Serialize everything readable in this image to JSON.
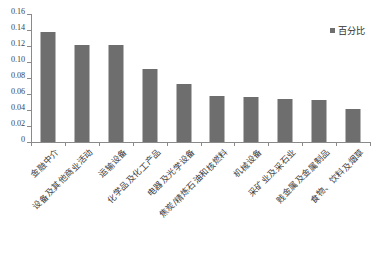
{
  "chart_data": {
    "type": "bar",
    "title": "",
    "subtitle": "",
    "xlabel": "",
    "ylabel": "",
    "ylim": [
      0,
      0.16
    ],
    "grid": false,
    "legend_position": "top-right",
    "y_ticks": [
      "0",
      "0.02",
      "0.04",
      "0.06",
      "0.08",
      "0.10",
      "0.12",
      "0.14",
      "0.16"
    ],
    "y_tick_values": [
      0,
      0.02,
      0.04,
      0.06,
      0.08,
      0.1,
      0.12,
      0.14,
      0.16
    ],
    "categories": [
      "金融中介",
      "设备及其他商业活动",
      "运输设备",
      "化学品及化工产品",
      "电器及光学设备",
      "焦炭/精炼石油和核燃料",
      "机械设备",
      "采矿业及采石业",
      "贱金属及金属制品",
      "食物、饮料及烟草"
    ],
    "series": [
      {
        "name": "百分比",
        "color": "#6e6e6e",
        "values": [
          0.138,
          0.121,
          0.121,
          0.091,
          0.073,
          0.057,
          0.056,
          0.054,
          0.052,
          0.041
        ]
      }
    ],
    "legend": [
      "百分比"
    ]
  },
  "legend": {
    "marker_name": "legend-color-swatch",
    "label": "百分比"
  }
}
